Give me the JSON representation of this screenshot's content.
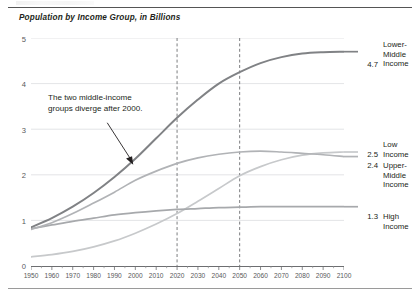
{
  "chart_data": {
    "type": "line",
    "title": "Population by Income Group, in Billions",
    "xlabel": "",
    "ylabel": "",
    "xlim": [
      1950,
      2100
    ],
    "ylim": [
      0,
      5
    ],
    "yticks": [
      0,
      1,
      2,
      3,
      4,
      5
    ],
    "grid": true,
    "legend_position": "right-of-plot",
    "x": [
      1950,
      1960,
      1970,
      1980,
      1990,
      2000,
      2010,
      2020,
      2030,
      2040,
      2050,
      2060,
      2070,
      2080,
      2090,
      2100
    ],
    "series": [
      {
        "name": "Lower-Middle Income",
        "end_value": 4.7,
        "color": "#808285",
        "values": [
          0.85,
          1.05,
          1.3,
          1.6,
          1.95,
          2.35,
          2.8,
          3.25,
          3.65,
          4.0,
          4.25,
          4.45,
          4.58,
          4.66,
          4.69,
          4.7
        ]
      },
      {
        "name": "Low Income",
        "end_value": 2.5,
        "color": "#c7c9cb",
        "values": [
          0.2,
          0.25,
          0.32,
          0.42,
          0.55,
          0.72,
          0.92,
          1.15,
          1.42,
          1.7,
          1.98,
          2.18,
          2.33,
          2.43,
          2.48,
          2.5
        ]
      },
      {
        "name": "Upper-Middle Income",
        "end_value": 2.4,
        "color": "#b1b3b6",
        "values": [
          0.8,
          0.95,
          1.15,
          1.38,
          1.62,
          1.88,
          2.08,
          2.25,
          2.37,
          2.45,
          2.5,
          2.52,
          2.5,
          2.47,
          2.44,
          2.4
        ]
      },
      {
        "name": "High Income",
        "end_value": 1.3,
        "color": "#a7a9ac",
        "values": [
          0.82,
          0.9,
          0.98,
          1.05,
          1.12,
          1.17,
          1.21,
          1.24,
          1.26,
          1.28,
          1.29,
          1.3,
          1.3,
          1.3,
          1.3,
          1.3
        ]
      }
    ],
    "reference_lines": [
      {
        "x": 2020,
        "style": "dashed"
      },
      {
        "x": 2050,
        "style": "dashed"
      }
    ],
    "annotations": [
      {
        "text_line_1": "The two middle-income",
        "text_line_2": "groups diverge after 2000.",
        "points_to_year": 2000,
        "arrow": true
      }
    ],
    "xtick_labels": [
      "1950",
      "1960",
      "1970",
      "1980",
      "1990",
      "2000",
      "2010",
      "2020",
      "2030",
      "2040",
      "2050",
      "2060",
      "2070",
      "2080",
      "2090",
      "2100"
    ],
    "ytick_labels": [
      "0",
      "1",
      "2",
      "3",
      "4",
      "5"
    ]
  },
  "legend": [
    {
      "value": "4.7",
      "label_line_1": "Lower-",
      "label_line_2": "Middle",
      "label_line_3": "Income"
    },
    {
      "value": "2.5",
      "label_line_1": "Low",
      "label_line_2": "Income",
      "label_line_3": ""
    },
    {
      "value": "2.4",
      "label_line_1": "Upper-",
      "label_line_2": "Middle",
      "label_line_3": "Income"
    },
    {
      "value": "1.3",
      "label_line_1": "High",
      "label_line_2": "Income",
      "label_line_3": ""
    }
  ]
}
